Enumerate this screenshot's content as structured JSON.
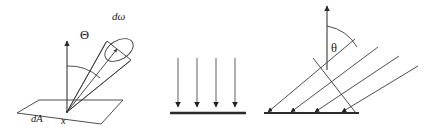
{
  "figure": {
    "background_color": "#ffffff",
    "stroke_color": "#3a3a3a",
    "label_color": "#1a1a1a",
    "panels": [
      {
        "name": "solid-angle-panel",
        "labels": {
          "theta_upper": "Θ",
          "domega": "dω",
          "dA": "dA",
          "point_x": "x"
        }
      },
      {
        "name": "normal-incidence-panel",
        "ray_count": "4",
        "labels": {}
      },
      {
        "name": "oblique-incidence-panel",
        "ray_count": "4",
        "labels": {
          "theta_lower": "θ"
        }
      }
    ]
  }
}
